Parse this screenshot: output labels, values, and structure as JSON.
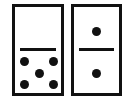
{
  "dominoes": [
    {
      "name": "left",
      "top_value": 0,
      "bottom_value": 5
    },
    {
      "name": "right",
      "top_value": 1,
      "bottom_value": 1
    }
  ],
  "colors": {
    "ink": "#111111",
    "background": "#ffffff"
  }
}
